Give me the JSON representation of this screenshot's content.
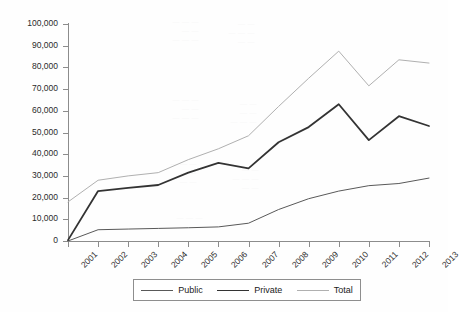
{
  "chart_data": {
    "type": "line",
    "title": "",
    "subtitle": "",
    "xlabel": "",
    "ylabel": "",
    "categories": [
      "2001",
      "2002",
      "2003",
      "2004",
      "2005",
      "2006",
      "2007",
      "2008",
      "2009",
      "2010",
      "2011",
      "2012",
      "2013"
    ],
    "x": [
      2001,
      2002,
      2003,
      2004,
      2005,
      2006,
      2007,
      2008,
      2009,
      2010,
      2011,
      2012,
      2013
    ],
    "series": [
      {
        "name": "Public",
        "color": "#595959",
        "line_width": 1,
        "values": [
          0,
          5200,
          5500,
          5800,
          6100,
          6500,
          8200,
          14500,
          19500,
          23000,
          25500,
          26500,
          29000
        ]
      },
      {
        "name": "Private",
        "color": "#333333",
        "line_width": 1.8,
        "values": [
          400,
          23000,
          24500,
          25800,
          31500,
          36000,
          33500,
          45500,
          52500,
          63000,
          46500,
          57500,
          53000
        ]
      },
      {
        "name": "Total",
        "color": "#b0b0b0",
        "line_width": 1,
        "values": [
          18000,
          28000,
          30000,
          31500,
          37500,
          42500,
          48500,
          62000,
          75000,
          87500,
          71500,
          83500,
          82000
        ]
      }
    ],
    "ylim": [
      0,
      100000
    ],
    "yticks": [
      0,
      10000,
      20000,
      30000,
      40000,
      50000,
      60000,
      70000,
      80000,
      90000,
      100000
    ],
    "ytick_labels": [
      "0",
      "10,000",
      "20,000",
      "30,000",
      "40,000",
      "50,000",
      "60,000",
      "70,000",
      "80,000",
      "90,000",
      "100,000"
    ],
    "grid": false,
    "legend_position": "bottom",
    "legend_entries": [
      "Public",
      "Private",
      "Total"
    ]
  },
  "bleed_through": {
    "a": "— — —\n— —\n— — —",
    "b": "— —\n— — —\n— —",
    "c": "— — —\n— —\n— — —",
    "d": "— —\n— —\n— — —",
    "e": "— — —\n— —\n— —",
    "f": "— —\n— — —\n— —",
    "g": "— — —\n— —"
  }
}
